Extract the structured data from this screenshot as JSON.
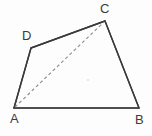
{
  "figure": {
    "name": "quadrilateral-abcd-with-diagonal",
    "canvas": {
      "width": 152,
      "height": 136,
      "background": "#fdfdfd"
    },
    "stroke_color": "#3a3a3a",
    "label_color": "#3b3b3b",
    "dashed_color": "#8c8c8c",
    "labels": {
      "a": "A",
      "b": "B",
      "c": "C",
      "d": "D"
    },
    "vertices": [
      {
        "id": "A",
        "x": 14,
        "y": 108
      },
      {
        "id": "B",
        "x": 139,
        "y": 108
      },
      {
        "id": "C",
        "x": 105,
        "y": 21
      },
      {
        "id": "D",
        "x": 31,
        "y": 48
      }
    ],
    "edges": [
      {
        "id": "AB",
        "from": "A",
        "to": "B",
        "style": "solid"
      },
      {
        "id": "BC",
        "from": "B",
        "to": "C",
        "style": "solid"
      },
      {
        "id": "CD",
        "from": "C",
        "to": "D",
        "style": "solid"
      },
      {
        "id": "DA",
        "from": "D",
        "to": "A",
        "style": "solid"
      }
    ],
    "diagonals": [
      {
        "id": "AC",
        "from": "A",
        "to": "C",
        "style": "dashed"
      }
    ],
    "marks": [
      {
        "id": "interior-dot",
        "x": 88,
        "y": 80
      }
    ]
  }
}
